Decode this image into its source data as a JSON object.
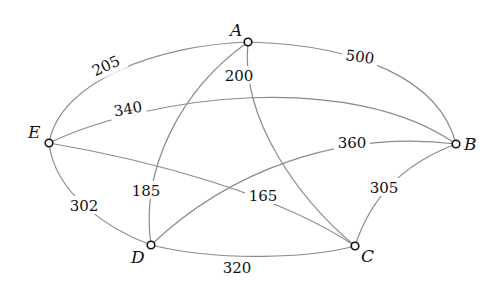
{
  "graph": {
    "nodes": [
      {
        "id": "A",
        "label": "A"
      },
      {
        "id": "B",
        "label": "B"
      },
      {
        "id": "C",
        "label": "C"
      },
      {
        "id": "D",
        "label": "D"
      },
      {
        "id": "E",
        "label": "E"
      }
    ],
    "edges": [
      {
        "from": "E",
        "to": "A",
        "weight": "205"
      },
      {
        "from": "A",
        "to": "B",
        "weight": "500"
      },
      {
        "from": "E",
        "to": "B",
        "weight": "340"
      },
      {
        "from": "A",
        "to": "C",
        "weight": "200"
      },
      {
        "from": "A",
        "to": "D",
        "weight": "185"
      },
      {
        "from": "E",
        "to": "C",
        "weight": "165"
      },
      {
        "from": "D",
        "to": "B",
        "weight": "360"
      },
      {
        "from": "E",
        "to": "D",
        "weight": "302"
      },
      {
        "from": "D",
        "to": "C",
        "weight": "320"
      },
      {
        "from": "C",
        "to": "B",
        "weight": "305"
      }
    ]
  }
}
